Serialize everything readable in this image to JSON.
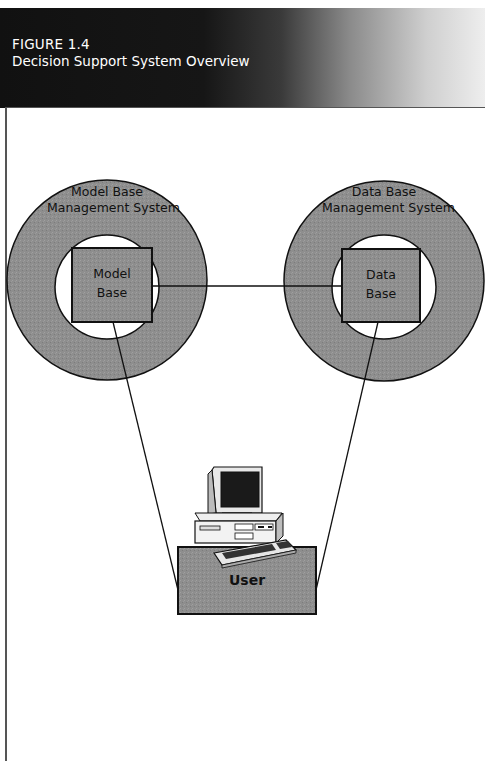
{
  "figure": {
    "number": "FIGURE 1.4",
    "title": "Decision Support System Overview"
  },
  "diagram": {
    "model_ring": {
      "line1": "Model Base",
      "line2": "Management System"
    },
    "model_box": {
      "line1": "Model",
      "line2": "Base"
    },
    "data_ring": {
      "line1": "Data Base",
      "line2": "Management System"
    },
    "data_box": {
      "line1": "Data",
      "line2": "Base"
    },
    "user_box": {
      "label": "User"
    },
    "computer": {
      "icon": "desktop-computer-icon"
    },
    "connections": [
      {
        "from": "Model Base",
        "to": "Data Base"
      },
      {
        "from": "Model Base",
        "to": "User"
      },
      {
        "from": "Data Base",
        "to": "User"
      }
    ]
  },
  "colors": {
    "ring_fill": "#8c8c8c",
    "box_fill": "#8f8f8f",
    "stroke": "#111111",
    "header_dark": "#111111"
  }
}
